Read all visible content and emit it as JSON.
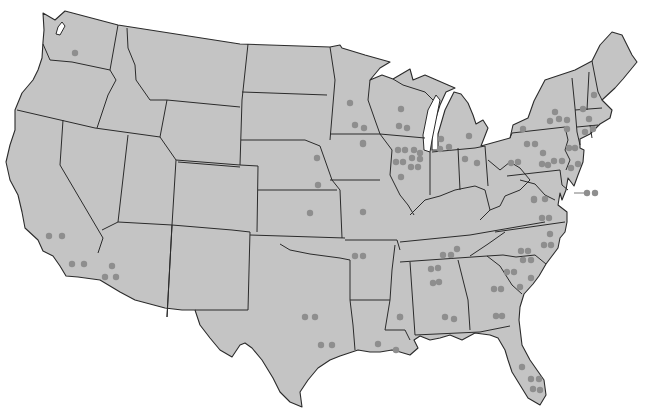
{
  "map": {
    "title": "United States",
    "caption_cutoff": "",
    "land_color": "#c4c4c4",
    "border_color": "#2b2b2b",
    "dot_color": "#8e8e8e",
    "background": "#ffffff",
    "dots": [
      {
        "region": "Washington",
        "x": 75,
        "y": 53
      },
      {
        "region": "California",
        "x": 49,
        "y": 236
      },
      {
        "region": "California",
        "x": 62,
        "y": 236
      },
      {
        "region": "California",
        "x": 72,
        "y": 264
      },
      {
        "region": "California",
        "x": 84,
        "y": 264
      },
      {
        "region": "Arizona",
        "x": 112,
        "y": 266
      },
      {
        "region": "Arizona",
        "x": 105,
        "y": 277
      },
      {
        "region": "Arizona",
        "x": 116,
        "y": 277
      },
      {
        "region": "Minnesota",
        "x": 350,
        "y": 103
      },
      {
        "region": "Minnesota",
        "x": 355,
        "y": 125
      },
      {
        "region": "Minnesota",
        "x": 364,
        "y": 128
      },
      {
        "region": "Wisconsin",
        "x": 401,
        "y": 109
      },
      {
        "region": "Wisconsin",
        "x": 399,
        "y": 126
      },
      {
        "region": "Wisconsin",
        "x": 407,
        "y": 128
      },
      {
        "region": "Iowa",
        "x": 363,
        "y": 143
      },
      {
        "region": "Iowa",
        "x": 364,
        "y": 15
      },
      {
        "region": "Illinois",
        "x": 398,
        "y": 150
      },
      {
        "region": "Illinois",
        "x": 405,
        "y": 150
      },
      {
        "region": "Illinois",
        "x": 414,
        "y": 150
      },
      {
        "region": "Illinois",
        "x": 420,
        "y": 153
      },
      {
        "region": "Illinois",
        "x": 396,
        "y": 162
      },
      {
        "region": "Illinois",
        "x": 403,
        "y": 162
      },
      {
        "region": "Illinois",
        "x": 412,
        "y": 158
      },
      {
        "region": "Illinois",
        "x": 420,
        "y": 159
      },
      {
        "region": "Illinois",
        "x": 411,
        "y": 167
      },
      {
        "region": "Illinois",
        "x": 418,
        "y": 167
      },
      {
        "region": "Illinois",
        "x": 401,
        "y": 177
      },
      {
        "region": "Michigan",
        "x": 441,
        "y": 139
      },
      {
        "region": "Michigan",
        "x": 440,
        "y": 149
      },
      {
        "region": "Michigan",
        "x": 449,
        "y": 147
      },
      {
        "region": "Michigan",
        "x": 469,
        "y": 136
      },
      {
        "region": "Ohio",
        "x": 465,
        "y": 159
      },
      {
        "region": "Ohio",
        "x": 477,
        "y": 163
      },
      {
        "region": "Nebraska",
        "x": 317,
        "y": 158
      },
      {
        "region": "Nebraska",
        "x": 318,
        "y": 185
      },
      {
        "region": "Iowa",
        "x": 363,
        "y": 144
      },
      {
        "region": "Kansas",
        "x": 310,
        "y": 213
      },
      {
        "region": "Missouri",
        "x": 363,
        "y": 212
      },
      {
        "region": "Arkansas",
        "x": 355,
        "y": 256
      },
      {
        "region": "Arkansas",
        "x": 363,
        "y": 256
      },
      {
        "region": "New York",
        "x": 555,
        "y": 112
      },
      {
        "region": "New York",
        "x": 550,
        "y": 121
      },
      {
        "region": "New York",
        "x": 559,
        "y": 119
      },
      {
        "region": "New York",
        "x": 567,
        "y": 120
      },
      {
        "region": "New York",
        "x": 567,
        "y": 129
      },
      {
        "region": "New York",
        "x": 523,
        "y": 129
      },
      {
        "region": "Vermont",
        "x": 583,
        "y": 109
      },
      {
        "region": "New Hampshire",
        "x": 594,
        "y": 95
      },
      {
        "region": "Massachusetts",
        "x": 589,
        "y": 119
      },
      {
        "region": "Connecticut",
        "x": 585,
        "y": 132
      },
      {
        "region": "Connecticut",
        "x": 593,
        "y": 129
      },
      {
        "region": "Pennsylvania",
        "x": 527,
        "y": 144
      },
      {
        "region": "Pennsylvania",
        "x": 535,
        "y": 144
      },
      {
        "region": "Pennsylvania",
        "x": 543,
        "y": 153
      },
      {
        "region": "Pennsylvania",
        "x": 511,
        "y": 163
      },
      {
        "region": "Pennsylvania",
        "x": 518,
        "y": 162
      },
      {
        "region": "Pennsylvania",
        "x": 542,
        "y": 164
      },
      {
        "region": "Pennsylvania",
        "x": 548,
        "y": 165
      },
      {
        "region": "Pennsylvania",
        "x": 554,
        "y": 161
      },
      {
        "region": "Pennsylvania",
        "x": 562,
        "y": 161
      },
      {
        "region": "New Jersey",
        "x": 569,
        "y": 148
      },
      {
        "region": "New Jersey",
        "x": 575,
        "y": 148
      },
      {
        "region": "New Jersey",
        "x": 571,
        "y": 168
      },
      {
        "region": "New Jersey",
        "x": 578,
        "y": 164
      },
      {
        "region": "Delaware offshore",
        "x": 587,
        "y": 193
      },
      {
        "region": "Delaware offshore",
        "x": 595,
        "y": 193
      },
      {
        "region": "Virginia",
        "x": 534,
        "y": 200
      },
      {
        "region": "Virginia",
        "x": 545,
        "y": 199
      },
      {
        "region": "Virginia",
        "x": 534,
        "y": 199
      },
      {
        "region": "Virginia",
        "x": 542,
        "y": 218
      },
      {
        "region": "Virginia",
        "x": 549,
        "y": 218
      },
      {
        "region": "North Carolina",
        "x": 550,
        "y": 234
      },
      {
        "region": "North Carolina",
        "x": 544,
        "y": 245
      },
      {
        "region": "North Carolina",
        "x": 551,
        "y": 245
      },
      {
        "region": "North Carolina",
        "x": 521,
        "y": 251
      },
      {
        "region": "North Carolina",
        "x": 528,
        "y": 251
      },
      {
        "region": "Tennessee",
        "x": 443,
        "y": 255
      },
      {
        "region": "Tennessee",
        "x": 451,
        "y": 255
      },
      {
        "region": "Tennessee",
        "x": 457,
        "y": 249
      },
      {
        "region": "South Carolina",
        "x": 523,
        "y": 260
      },
      {
        "region": "South Carolina",
        "x": 531,
        "y": 260
      },
      {
        "region": "South Carolina",
        "x": 507,
        "y": 272
      },
      {
        "region": "South Carolina",
        "x": 514,
        "y": 272
      },
      {
        "region": "South Carolina",
        "x": 531,
        "y": 278
      },
      {
        "region": "South Carolina",
        "x": 520,
        "y": 287
      },
      {
        "region": "Alabama",
        "x": 431,
        "y": 269
      },
      {
        "region": "Alabama",
        "x": 438,
        "y": 268
      },
      {
        "region": "Alabama",
        "x": 433,
        "y": 283
      },
      {
        "region": "Alabama",
        "x": 439,
        "y": 282
      },
      {
        "region": "Georgia",
        "x": 494,
        "y": 289
      },
      {
        "region": "Georgia",
        "x": 501,
        "y": 289
      },
      {
        "region": "Mississippi",
        "x": 400,
        "y": 317
      },
      {
        "region": "Alabama",
        "x": 445,
        "y": 317
      },
      {
        "region": "Alabama",
        "x": 454,
        "y": 319
      },
      {
        "region": "Georgia",
        "x": 496,
        "y": 316
      },
      {
        "region": "Georgia",
        "x": 502,
        "y": 316
      },
      {
        "region": "Oklahoma",
        "x": 305,
        "y": 317
      },
      {
        "region": "Oklahoma",
        "x": 315,
        "y": 317
      },
      {
        "region": "Texas",
        "x": 321,
        "y": 345
      },
      {
        "region": "Texas",
        "x": 332,
        "y": 345
      },
      {
        "region": "Louisiana",
        "x": 378,
        "y": 344
      },
      {
        "region": "Louisiana",
        "x": 396,
        "y": 350
      },
      {
        "region": "Louisiana",
        "x": 400,
        "y": 317
      },
      {
        "region": "Florida",
        "x": 522,
        "y": 367
      },
      {
        "region": "Florida",
        "x": 531,
        "y": 379
      },
      {
        "region": "Florida",
        "x": 539,
        "y": 379
      },
      {
        "region": "Florida",
        "x": 533,
        "y": 389
      },
      {
        "region": "Florida",
        "x": 540,
        "y": 390
      }
    ]
  }
}
